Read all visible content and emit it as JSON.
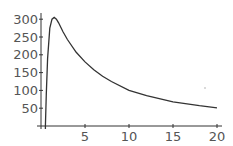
{
  "chart_data": {
    "type": "line",
    "title": "",
    "xlabel": "",
    "ylabel": "",
    "xlim": [
      0,
      20
    ],
    "ylim": [
      0,
      310
    ],
    "grid": false,
    "legend": null,
    "x_ticks": [
      5,
      10,
      15,
      20
    ],
    "y_ticks": [
      50,
      100,
      150,
      200,
      250,
      300
    ],
    "series": [
      {
        "name": "f(t)",
        "color": "#333333",
        "x": [
          0.5,
          0.6,
          0.75,
          1.0,
          1.25,
          1.5,
          1.75,
          2.0,
          2.5,
          3.0,
          4.0,
          5.0,
          6.0,
          7.0,
          8.0,
          10.0,
          12.0,
          15.0,
          18.0,
          20.0
        ],
        "y": [
          0,
          90,
          190,
          275,
          300,
          305,
          300,
          290,
          265,
          243,
          207,
          180,
          158,
          140,
          125,
          100,
          85,
          68,
          57,
          51
        ]
      }
    ]
  },
  "plot": {
    "x_tick_labels": [
      "5",
      "10",
      "15",
      "20"
    ],
    "y_tick_labels": [
      "50",
      "100",
      "150",
      "200",
      "250",
      "300"
    ]
  }
}
